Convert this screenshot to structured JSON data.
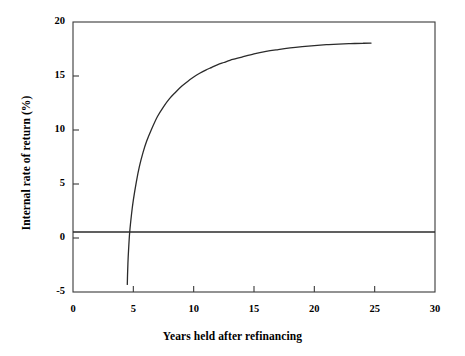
{
  "chart_data": {
    "type": "line",
    "title": "",
    "xlabel": "Years held after refinancing",
    "ylabel": "Internal rate of return (%)",
    "xlim": [
      0,
      30
    ],
    "ylim": [
      -5,
      20
    ],
    "xticks": [
      0,
      5,
      10,
      15,
      20,
      25,
      30
    ],
    "xtick_labels": [
      "0",
      "5",
      "10",
      "15",
      "20",
      "25",
      "30"
    ],
    "yticks": [
      -5,
      0,
      5,
      10,
      15,
      20
    ],
    "ytick_labels": [
      "-5",
      "0",
      "5",
      "10",
      "15",
      "20"
    ],
    "grid": false,
    "legend": null,
    "frame": "box",
    "tick_direction": "in",
    "series": [
      {
        "name": "Internal rate of return",
        "type": "line",
        "color": "#2b2b2b",
        "x": [
          4.5,
          4.52,
          4.55,
          4.6,
          4.7,
          4.85,
          5.0,
          5.25,
          5.5,
          5.8,
          6.1,
          6.5,
          7.0,
          7.5,
          8.0,
          8.5,
          9.0,
          9.5,
          10.0,
          10.5,
          11.0,
          11.5,
          12.0,
          12.5,
          13.0,
          13.5,
          14.0,
          15.0,
          16.0,
          17.0,
          18.0,
          19.0,
          20.0,
          21.0,
          22.0,
          23.0,
          24.0,
          24.7
        ],
        "y": [
          -4.3,
          -3.4,
          -2.4,
          -1.2,
          0.55,
          2.2,
          3.5,
          5.2,
          6.6,
          7.9,
          8.95,
          10.05,
          11.25,
          12.15,
          12.9,
          13.5,
          14.05,
          14.5,
          14.9,
          15.25,
          15.55,
          15.8,
          16.05,
          16.25,
          16.45,
          16.6,
          16.75,
          17.05,
          17.28,
          17.45,
          17.6,
          17.72,
          17.82,
          17.9,
          17.96,
          18.0,
          18.03,
          18.05
        ]
      },
      {
        "name": "Zero reference line",
        "type": "hline",
        "color": "#2b2b2b",
        "y": 0.55
      }
    ],
    "annotations": [],
    "curve_start": {
      "x": 4.5,
      "y": -4.3
    },
    "curve_end": {
      "x": 24.7,
      "y": 18.05
    },
    "breakeven_year": 4.62,
    "asymptote": 18.05
  },
  "colors": {
    "background": "#ffffff",
    "axis": "#3a3a3a",
    "curve": "#2b2b2b",
    "text": "#000000"
  }
}
